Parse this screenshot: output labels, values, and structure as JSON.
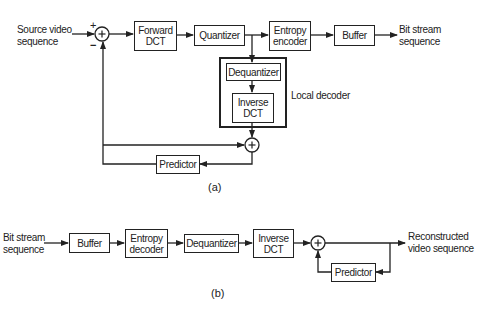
{
  "encoder": {
    "input_label_1": "Source video",
    "input_label_2": "sequence",
    "plus_sign": "+",
    "minus_sign": "−",
    "forward_dct_1": "Forward",
    "forward_dct_2": "DCT",
    "quantizer": "Quantizer",
    "entropy_encoder_1": "Entropy",
    "entropy_encoder_2": "encoder",
    "buffer": "Buffer",
    "output_label_1": "Bit stream",
    "output_label_2": "sequence",
    "dequantizer": "Dequantizer",
    "inverse_dct_1": "Inverse",
    "inverse_dct_2": "DCT",
    "local_decoder_label": "Local decoder",
    "predictor": "Predictor",
    "caption": "(a)"
  },
  "decoder": {
    "input_label_1": "Bit stream",
    "input_label_2": "sequence",
    "buffer": "Buffer",
    "entropy_decoder_1": "Entropy",
    "entropy_decoder_2": "decoder",
    "dequantizer": "Dequantizer",
    "inverse_dct_1": "Inverse",
    "inverse_dct_2": "DCT",
    "predictor": "Predictor",
    "output_label_1": "Reconstructed",
    "output_label_2": "video sequence",
    "caption": "(b)"
  },
  "summing_symbol": "+"
}
